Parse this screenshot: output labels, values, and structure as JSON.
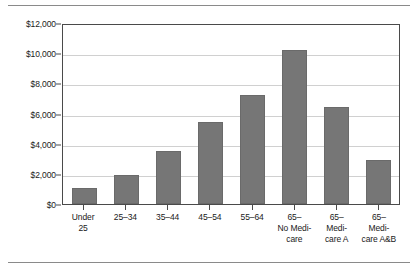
{
  "chart_data": {
    "type": "bar",
    "title": "",
    "xlabel": "",
    "ylabel": "",
    "ylim": [
      0,
      12000
    ],
    "grid": true,
    "legend": "none",
    "categories": [
      "Under 25",
      "25–34",
      "35–44",
      "45–54",
      "55–64",
      "65– No Medicare",
      "65– Medicare A",
      "65– Medicare A&B"
    ],
    "category_lines": [
      [
        "Under",
        "25"
      ],
      [
        "25–34"
      ],
      [
        "35–44"
      ],
      [
        "45–54"
      ],
      [
        "55–64"
      ],
      [
        "65–",
        "No Medi-",
        "care"
      ],
      [
        "65–",
        "Medi-",
        "care A"
      ],
      [
        "65–",
        "Medi-",
        "care A&B"
      ]
    ],
    "values": [
      1050,
      1900,
      3500,
      5450,
      7200,
      10200,
      6450,
      2900
    ],
    "ytick_values": [
      0,
      2000,
      4000,
      6000,
      8000,
      10000,
      12000
    ],
    "ytick_labels": [
      "$0",
      "$2,000",
      "$4,000",
      "$6,000",
      "$8,000",
      "$10,000",
      "$12,000"
    ],
    "colors": {
      "bar_fill": "#767676",
      "bar_stroke": "#6a6a6a",
      "grid": "#d0d0d0",
      "axis": "#4a4a4a",
      "frame": "#8a8a8a",
      "text": "#1a1a1a",
      "background": "#ffffff"
    }
  }
}
